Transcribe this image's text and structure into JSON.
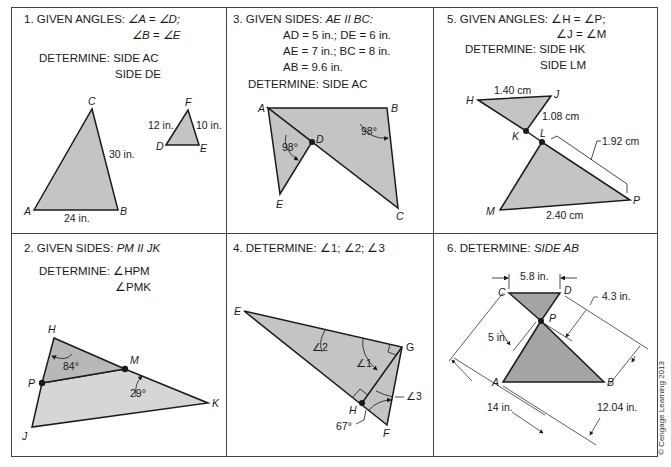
{
  "panels": [
    {
      "number": "1.",
      "given_label": "GIVEN ANGLES:",
      "given_lines": [
        "∠A = ∠D;",
        "∠B = ∠E"
      ],
      "determine_label": "DETERMINE:",
      "determine_lines": [
        "SIDE AC",
        "SIDE DE"
      ],
      "vertices": {
        "A": "A",
        "B": "B",
        "C": "C",
        "D": "D",
        "E": "E",
        "F": "F"
      },
      "dimensions": {
        "AB": "24 in.",
        "BC": "30 in.",
        "DF": "12 in.",
        "FE": "10 in."
      }
    },
    {
      "number": "2.",
      "given_label": "GIVEN SIDES:",
      "given_lines": [
        "PM II JK"
      ],
      "determine_label": "DETERMINE:",
      "determine_lines": [
        "∠HPM",
        "∠PMK"
      ],
      "vertices": {
        "H": "H",
        "M": "M",
        "P": "P",
        "K": "K",
        "J": "J"
      },
      "angles": {
        "H": "84°",
        "K": "29°"
      }
    },
    {
      "number": "3.",
      "given_label": "GIVEN SIDES:",
      "given_lines": [
        "AE II BC:",
        "AD = 5 in.; DE = 6 in.",
        "AE = 7 in.; BC = 8 in.",
        "AB = 9.6 in."
      ],
      "determine_label": "DETERMINE:",
      "determine_lines": [
        "SIDE AC"
      ],
      "vertices": {
        "A": "A",
        "B": "B",
        "C": "C",
        "D": "D",
        "E": "E"
      },
      "angles": {
        "ADE": "98°",
        "ABC": "98°"
      }
    },
    {
      "number": "4.",
      "determine_label": "DETERMINE:",
      "determine_lines": [
        "∠1; ∠2; ∠3"
      ],
      "vertices": {
        "E": "E",
        "G": "G",
        "H": "H",
        "F": "F"
      },
      "angles": {
        "a1": "∠1",
        "a2": "∠2",
        "a3": "∠3",
        "F": "67°"
      }
    },
    {
      "number": "5.",
      "given_label": "GIVEN ANGLES:",
      "given_lines": [
        "∠H = ∠P;",
        "∠J = ∠M"
      ],
      "determine_label": "DETERMINE:",
      "determine_lines": [
        "SIDE HK",
        "SIDE LM"
      ],
      "vertices": {
        "H": "H",
        "J": "J",
        "K": "K",
        "L": "L",
        "M": "M",
        "P": "P"
      },
      "dimensions": {
        "HJ": "1.40 cm",
        "JK": "1.08 cm",
        "LP": "1.92 cm",
        "MP": "2.40 cm"
      }
    },
    {
      "number": "6.",
      "determine_label": "DETERMINE:",
      "determine_lines": [
        "SIDE AB"
      ],
      "vertices": {
        "C": "C",
        "D": "D",
        "P": "P",
        "A": "A",
        "B": "B"
      },
      "dimensions": {
        "CD": "5.8 in.",
        "DP": "4.3 in.",
        "CP": "5 in.",
        "CA": "14 in.",
        "DB": "12.04 in."
      }
    }
  ],
  "copyright": "© Cengage Learning 2013",
  "colors": {
    "fill_light": "#d4d4d4",
    "fill_mid": "#c4c4c4",
    "fill_dark": "#a4a4a4",
    "stroke": "#1a1a1a",
    "border": "#444444"
  }
}
